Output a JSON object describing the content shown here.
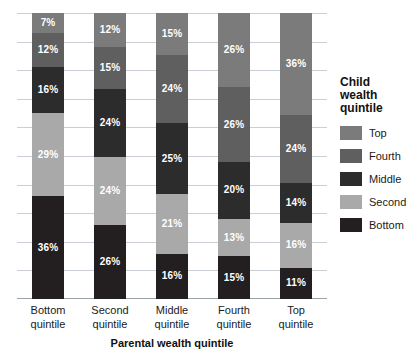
{
  "chart_data": {
    "type": "bar",
    "subtype": "stacked-100-percent",
    "title": "",
    "xlabel": "Parental wealth quintile",
    "ylabel": "",
    "ylim": [
      0,
      100
    ],
    "grid": true,
    "gridline_values": [
      10,
      20,
      30,
      40,
      50,
      60,
      70,
      80,
      90,
      100
    ],
    "legend_position": "right",
    "legend_title": "Child wealth quintile",
    "categories": [
      "Bottom quintile",
      "Second quintile",
      "Middle quintile",
      "Fourth quintile",
      "Top quintile"
    ],
    "series": [
      {
        "name": "Top",
        "color": "#7b7b7b",
        "values": [
          7,
          12,
          15,
          26,
          36
        ]
      },
      {
        "name": "Fourth",
        "color": "#5f5f5f",
        "values": [
          12,
          15,
          24,
          26,
          24
        ]
      },
      {
        "name": "Middle",
        "color": "#2c2c2c",
        "values": [
          16,
          24,
          25,
          20,
          14
        ]
      },
      {
        "name": "Second",
        "color": "#a9a9a9",
        "values": [
          29,
          24,
          21,
          13,
          16
        ]
      },
      {
        "name": "Bottom",
        "color": "#231f20",
        "values": [
          36,
          26,
          16,
          15,
          11
        ]
      }
    ],
    "value_labels": {
      "Bottom quintile": [
        "7%",
        "12%",
        "16%",
        "29%",
        "36%"
      ],
      "Second quintile": [
        "12%",
        "15%",
        "24%",
        "24%",
        "26%"
      ],
      "Middle quintile": [
        "15%",
        "24%",
        "25%",
        "21%",
        "16%"
      ],
      "Fourth quintile": [
        "26%",
        "26%",
        "20%",
        "13%",
        "15%"
      ],
      "Top quintile": [
        "36%",
        "24%",
        "14%",
        "16%",
        "11%"
      ]
    }
  },
  "axis": {
    "x_title": "Parental wealth quintile",
    "x_tick_labels": [
      {
        "line1": "Bottom",
        "line2": "quintile"
      },
      {
        "line1": "Second",
        "line2": "quintile"
      },
      {
        "line1": "Middle",
        "line2": "quintile"
      },
      {
        "line1": "Fourth",
        "line2": "quintile"
      },
      {
        "line1": "Top",
        "line2": "quintile"
      }
    ]
  },
  "legend": {
    "title_line1": "Child",
    "title_line2": "wealth",
    "title_line3": "quintile",
    "items": [
      {
        "label": "Top",
        "color": "#7b7b7b"
      },
      {
        "label": "Fourth",
        "color": "#5f5f5f"
      },
      {
        "label": "Middle",
        "color": "#2c2c2c"
      },
      {
        "label": "Second",
        "color": "#a9a9a9"
      },
      {
        "label": "Bottom",
        "color": "#231f20"
      }
    ]
  },
  "colors": {
    "gridline": "#c9cfd4",
    "axis": "#9aa3aa",
    "label_text": "#ffffff",
    "background": "#ffffff"
  }
}
